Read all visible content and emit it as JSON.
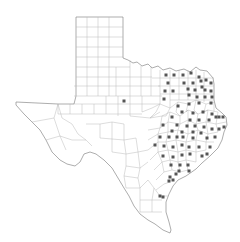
{
  "map": {
    "title": "Texas counties",
    "region": "Texas",
    "colors": {
      "background": "#ffffff",
      "state_border": "#8a8a8a",
      "county_border": "#b4b4b4",
      "marker": "#555555"
    },
    "marker_shape": "small square",
    "marker_size_px": 3,
    "marker_count": 95,
    "markers": [
      [
        166,
        75
      ],
      [
        174,
        75
      ],
      [
        183,
        75
      ],
      [
        191,
        73
      ],
      [
        199,
        77
      ],
      [
        168,
        83
      ],
      [
        184,
        83
      ],
      [
        193,
        83
      ],
      [
        201,
        81
      ],
      [
        206,
        80
      ],
      [
        211,
        83
      ],
      [
        165,
        91
      ],
      [
        173,
        91
      ],
      [
        188,
        89
      ],
      [
        195,
        90
      ],
      [
        202,
        87
      ],
      [
        205,
        90
      ],
      [
        211,
        91
      ],
      [
        164,
        99
      ],
      [
        189,
        95
      ],
      [
        197,
        97
      ],
      [
        205,
        97
      ],
      [
        212,
        97
      ],
      [
        124,
        101
      ],
      [
        178,
        106
      ],
      [
        189,
        104
      ],
      [
        199,
        103
      ],
      [
        211,
        103
      ],
      [
        182,
        112
      ],
      [
        193,
        113
      ],
      [
        203,
        112
      ],
      [
        212,
        114
      ],
      [
        219,
        117
      ],
      [
        172,
        117
      ],
      [
        190,
        120
      ],
      [
        199,
        120
      ],
      [
        209,
        120
      ],
      [
        216,
        117
      ],
      [
        223,
        117
      ],
      [
        163,
        125
      ],
      [
        177,
        125
      ],
      [
        187,
        126
      ],
      [
        195,
        126
      ],
      [
        204,
        127
      ],
      [
        212,
        129
      ],
      [
        219,
        129
      ],
      [
        224,
        127
      ],
      [
        172,
        131
      ],
      [
        182,
        132
      ],
      [
        193,
        132
      ],
      [
        201,
        133
      ],
      [
        160,
        137
      ],
      [
        169,
        137
      ],
      [
        177,
        137
      ],
      [
        183,
        137
      ],
      [
        193,
        138
      ],
      [
        207,
        138
      ],
      [
        215,
        137
      ],
      [
        155,
        145
      ],
      [
        164,
        146
      ],
      [
        173,
        147
      ],
      [
        182,
        145
      ],
      [
        189,
        147
      ],
      [
        199,
        147
      ],
      [
        210,
        147
      ],
      [
        163,
        156
      ],
      [
        173,
        157
      ],
      [
        182,
        155
      ],
      [
        190,
        154
      ],
      [
        202,
        156
      ],
      [
        207,
        154
      ],
      [
        171,
        165
      ],
      [
        180,
        165
      ],
      [
        188,
        165
      ],
      [
        179,
        171
      ],
      [
        189,
        171
      ],
      [
        176,
        174
      ],
      [
        170,
        177
      ],
      [
        173,
        180
      ],
      [
        169,
        181
      ],
      [
        160,
        196
      ],
      [
        163,
        197
      ]
    ]
  }
}
